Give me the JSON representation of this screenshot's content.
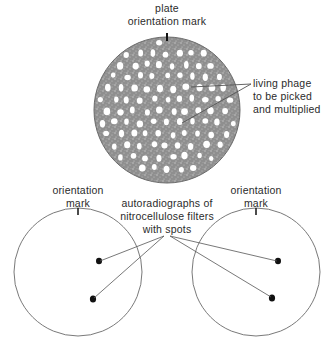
{
  "top_plate": {
    "label_line1": "plate",
    "label_line2": "orientation mark",
    "callout_line1": "living phage",
    "callout_line2": "to be picked",
    "callout_line3": "and multiplied",
    "fill_color": "#9a9a9a",
    "plaque_color": "#ffffff"
  },
  "left_filter": {
    "label_line1": "orientation",
    "label_line2": "mark"
  },
  "right_filter": {
    "label_line1": "orientation",
    "label_line2": "mark"
  },
  "middle_callout": {
    "line1": "autoradiographs of",
    "line2": "nitrocellulose filters",
    "line3": "with spots"
  },
  "colors": {
    "line": "#555555",
    "spot": "#111111",
    "text": "#2b2b2b"
  }
}
